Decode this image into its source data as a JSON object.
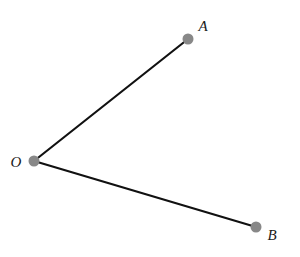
{
  "diagram": {
    "type": "angle",
    "colors": {
      "line": "#111111",
      "point": "#888888",
      "label": "#1a1a1a",
      "background": "#ffffff"
    },
    "points": [
      {
        "id": "O",
        "label": "O",
        "x": 34,
        "y": 161,
        "label_x": 16,
        "label_y": 167
      },
      {
        "id": "A",
        "label": "A",
        "x": 188,
        "y": 39,
        "label_x": 203,
        "label_y": 31
      },
      {
        "id": "B",
        "label": "B",
        "x": 256,
        "y": 227,
        "label_x": 272,
        "label_y": 240
      }
    ],
    "segments": [
      {
        "from": "O",
        "to": "A"
      },
      {
        "from": "O",
        "to": "B"
      }
    ]
  }
}
